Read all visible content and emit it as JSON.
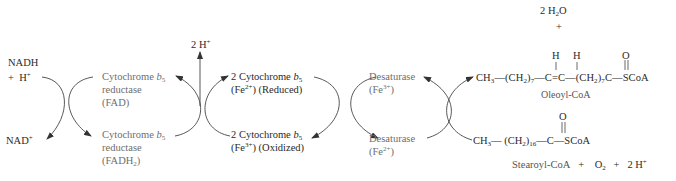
{
  "colors": {
    "ink": "#2a2a2a",
    "enzyme_text": "#6e6e6e",
    "arrow": "#333333"
  },
  "cycle1": {
    "top_left": {
      "main": "NADH",
      "plus": "+",
      "h": "H",
      "h_sup": "+"
    },
    "bottom_left": {
      "main": "NAD",
      "sup": "+"
    },
    "top_right": {
      "line1": "Cytochrome ",
      "line1_italic": "b",
      "line1_sub": "5",
      "line2": "reductase",
      "line3": "(FAD)"
    },
    "bottom_right": {
      "line1": "Cytochrome ",
      "line1_italic": "b",
      "line1_sub": "5",
      "line2": "reductase",
      "line3_pre": "(FADH",
      "line3_sub": "2",
      "line3_post": ")"
    }
  },
  "proton_release": {
    "text": "2 H",
    "sup": "+"
  },
  "cycle2": {
    "top_right": {
      "line1": "2 Cytochrome ",
      "line1_italic": "b",
      "line1_sub": "5",
      "line2_pre": "(Fe",
      "line2_sup": "2+",
      "line2_post": ") (Reduced)"
    },
    "bottom_right": {
      "line1": "2 Cytochrome ",
      "line1_italic": "b",
      "line1_sub": "5",
      "line2_pre": "(Fe",
      "line2_sup": "3+",
      "line2_post": ") (Oxidized)"
    }
  },
  "cycle3": {
    "top_right": {
      "line1": "Desaturase",
      "line2_pre": "(Fe",
      "line2_sup": "3+",
      "line2_post": ")"
    },
    "bottom_right": {
      "line1": "Desaturase",
      "line2_pre": "(Fe",
      "line2_sup": "2+",
      "line2_post": ")"
    }
  },
  "products": {
    "water": {
      "pre": "2 H",
      "sub": "2",
      "post": "O"
    },
    "plus": "+",
    "oleoyl": {
      "ch3": "CH",
      "ch3_sub": "3",
      "dash": "—",
      "ch2a": "(CH",
      "ch2a_sub": "2",
      "ch2a_close": ")",
      "ch2a_n": "7",
      "c1": "C",
      "double_bond": "=",
      "c2": "C",
      "ch2b": "(CH",
      "ch2b_sub": "2",
      "ch2b_close": ")",
      "ch2b_n": "7",
      "c3": "C",
      "scoa": "SCoA",
      "h1": "H",
      "h2": "H",
      "o": "O",
      "name": "Oleoyl-CoA"
    }
  },
  "reactants": {
    "stearoyl": {
      "ch3": "CH",
      "ch3_sub": "3",
      "ch2": "(CH",
      "ch2_sub": "2",
      "ch2_close": ")",
      "ch2_n": "16",
      "c": "C",
      "scoa": "SCoA",
      "o": "O",
      "dash": "—"
    },
    "equation": {
      "name": "Stearoyl-CoA",
      "plus1": "+",
      "o2": "O",
      "o2_sub": "2",
      "plus2": "+",
      "h": "2 H",
      "h_sup": "+"
    }
  }
}
